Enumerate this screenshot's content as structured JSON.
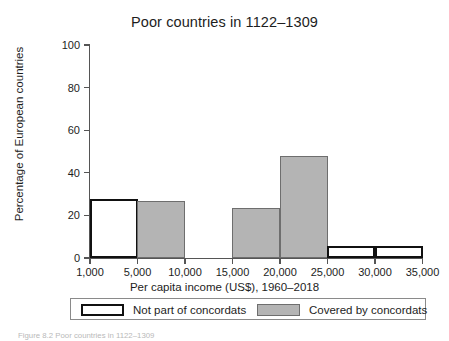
{
  "chart_data": {
    "type": "bar",
    "title": "Poor countries in 1122–1309",
    "xlabel": "Per capita income (US$), 1960–2018",
    "ylabel": "Percentage of European countries",
    "xlim": [
      1000,
      35000
    ],
    "ylim": [
      0,
      100
    ],
    "grid": false,
    "xticks": [
      1000,
      5000,
      10000,
      15000,
      20000,
      25000,
      30000,
      35000
    ],
    "xtick_labels": [
      "1,000",
      "5,000",
      "10,000",
      "15,000",
      "20,000",
      "25,000",
      "30,000",
      "35,000"
    ],
    "yticks": [
      0,
      20,
      40,
      60,
      80,
      100
    ],
    "ytick_labels": [
      "0",
      "20",
      "40",
      "60",
      "80",
      "100"
    ],
    "legend_position": "below-axis",
    "series": [
      {
        "name": "Not part of concordats",
        "style": "open",
        "fill": "#ffffff",
        "edge": "#111111",
        "bins": [
          {
            "x0": 1000,
            "x1": 5000,
            "value": 27.5
          },
          {
            "x0": 25000,
            "x1": 30000,
            "value": 5.6
          },
          {
            "x0": 30000,
            "x1": 35000,
            "value": 5.6
          }
        ]
      },
      {
        "name": "Covered by concordats",
        "style": "filled",
        "fill": "#b4b4b4",
        "edge": "#6e6e6e",
        "bins": [
          {
            "x0": 5000,
            "x1": 10000,
            "value": 26.8
          },
          {
            "x0": 15000,
            "x1": 20000,
            "value": 23.5
          },
          {
            "x0": 20000,
            "x1": 25000,
            "value": 48.0
          }
        ]
      }
    ],
    "bars": [
      {
        "label": "1,000–5,000",
        "series": "Not part of concordats",
        "value": 27.5,
        "left_px": 90,
        "width_px": 47.5
      },
      {
        "label": "5,000–10,000",
        "series": "Covered by concordats",
        "value": 26.8,
        "left_px": 137,
        "width_px": 47.5
      },
      {
        "label": "15,000–20,000",
        "series": "Covered by concordats",
        "value": 23.5,
        "left_px": 232,
        "width_px": 47.5
      },
      {
        "label": "20,000–25,000",
        "series": "Covered by concordats",
        "value": 48.0,
        "left_px": 280,
        "width_px": 47.5
      },
      {
        "label": "25,000–30,000",
        "series": "Not part of concordats",
        "value": 5.6,
        "left_px": 327,
        "width_px": 47.5
      },
      {
        "label": "30,000–35,000",
        "series": "Not part of concordats",
        "value": 5.6,
        "left_px": 375,
        "width_px": 47.5
      }
    ]
  },
  "legend": {
    "items": [
      {
        "label": "Not part of concordats",
        "style": "open"
      },
      {
        "label": "Covered by concordats",
        "style": "filled"
      }
    ]
  },
  "caption": {
    "text": "Figure 8.2  Poor countries in 1122–1309"
  },
  "colors": {
    "filled": "#b4b4b4",
    "filled_edge": "#6e6e6e",
    "open_edge": "#111111",
    "axis": "#555555",
    "text": "#1d1d1d"
  }
}
